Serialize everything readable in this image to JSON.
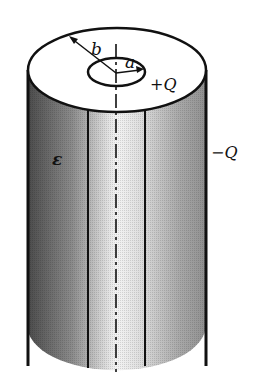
{
  "figure": {
    "type": "cylindrical-capacitor",
    "labels": {
      "outer_radius": "b",
      "inner_radius": "a",
      "inner_charge": "+Q",
      "outer_charge": "−Q",
      "dielectric": "ε"
    }
  }
}
